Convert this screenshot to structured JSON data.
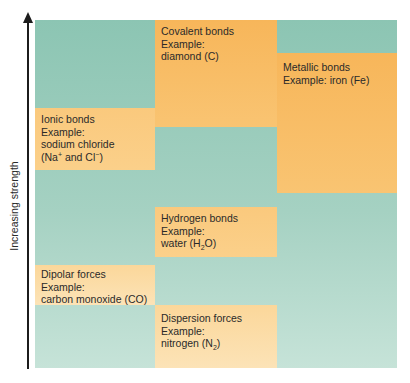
{
  "axis": {
    "label": "Increasing strength",
    "direction": "up"
  },
  "colors": {
    "background_weak": "#a5d1c2",
    "block_strong": "#f7b65a",
    "block_light": "#fce3b7",
    "text": "#2a2a2a",
    "axis": "#1c1c1c"
  },
  "blocks": [
    {
      "id": "covalent",
      "title": "Covalent bonds",
      "example_label": "Example:",
      "example": "diamond (C)"
    },
    {
      "id": "metallic",
      "title": "Metallic bonds",
      "example_label": "Example:",
      "example": "iron (Fe)"
    },
    {
      "id": "ionic",
      "title": "Ionic bonds",
      "example_label": "Example:",
      "example": "sodium chloride",
      "example_line2_pre": "(Na",
      "example_line2_sup1": "+",
      "example_line2_mid": " and Cl",
      "example_line2_sup2": "−",
      "example_line2_post": ")"
    },
    {
      "id": "hydrogen",
      "title": "Hydrogen bonds",
      "example_label": "Example:",
      "example_pre": "water (H",
      "example_sub": "2",
      "example_post": "O)"
    },
    {
      "id": "dipolar",
      "title": "Dipolar forces",
      "example_label": "Example:",
      "example": "carbon monoxide (CO)"
    },
    {
      "id": "dispersion",
      "title": "Dispersion forces",
      "example_label": "Example:",
      "example_pre": "nitrogen (N",
      "example_sub": "2",
      "example_post": ")"
    }
  ]
}
